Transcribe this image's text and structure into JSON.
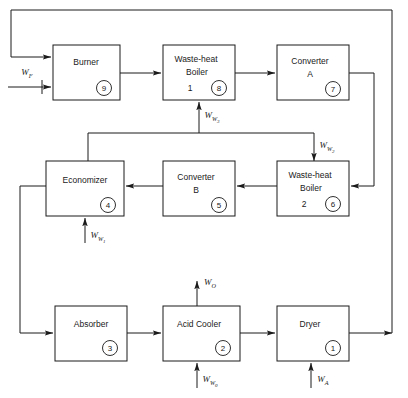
{
  "diagram": {
    "line_color": "#1a1a1a",
    "background": "#ffffff",
    "units": [
      {
        "id": "dryer",
        "tag": "1",
        "line1": "Dryer",
        "line2": "",
        "line3": ""
      },
      {
        "id": "acid-cooler",
        "tag": "2",
        "line1": "Acid Cooler",
        "line2": "",
        "line3": ""
      },
      {
        "id": "absorber",
        "tag": "3",
        "line1": "Absorber",
        "line2": "",
        "line3": ""
      },
      {
        "id": "economizer",
        "tag": "4",
        "line1": "Economizer",
        "line2": "",
        "line3": ""
      },
      {
        "id": "converter-b",
        "tag": "5",
        "line1": "Converter",
        "line2": "B",
        "line3": ""
      },
      {
        "id": "boiler-2",
        "tag": "6",
        "line1": "Waste-heat",
        "line2": "Boiler",
        "line3": "2"
      },
      {
        "id": "converter-a",
        "tag": "7",
        "line1": "Converter",
        "line2": "A",
        "line3": ""
      },
      {
        "id": "boiler-1",
        "tag": "8",
        "line1": "Waste-heat",
        "line2": "Boiler",
        "line3": "1"
      },
      {
        "id": "burner",
        "tag": "9",
        "line1": "Burner",
        "line2": "",
        "line3": ""
      }
    ],
    "streams": [
      {
        "id": "wf",
        "symbol": "W",
        "sub": "F",
        "sub2": "",
        "description": "fuel feed to burner"
      },
      {
        "id": "ww3",
        "symbol": "W",
        "sub": "W",
        "sub2": "3",
        "description": "water to waste-heat boiler 1"
      },
      {
        "id": "ww2",
        "symbol": "W",
        "sub": "W",
        "sub2": "2",
        "description": "water to waste-heat boiler 2"
      },
      {
        "id": "ww1",
        "symbol": "W",
        "sub": "W",
        "sub2": "1",
        "description": "water to economizer"
      },
      {
        "id": "wo",
        "symbol": "W",
        "sub": "O",
        "sub2": "",
        "description": "acid product from acid cooler"
      },
      {
        "id": "ww0",
        "symbol": "W",
        "sub": "W",
        "sub2": "0",
        "description": "water to acid cooler"
      },
      {
        "id": "wa",
        "symbol": "W",
        "sub": "A",
        "sub2": "",
        "description": "air to dryer"
      }
    ]
  }
}
